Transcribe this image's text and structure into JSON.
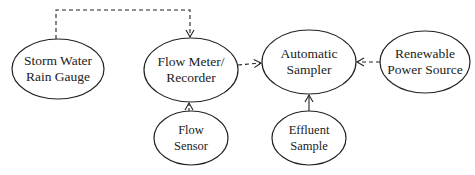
{
  "diagram": {
    "nodes": [
      {
        "id": "rain",
        "label_1": "Storm Water",
        "label_2": "Rain Gauge"
      },
      {
        "id": "meter",
        "label_1": "Flow Meter/",
        "label_2": "Recorder"
      },
      {
        "id": "sampler",
        "label_1": "Automatic",
        "label_2": "Sampler"
      },
      {
        "id": "power",
        "label_1": "Renewable",
        "label_2": "Power Source"
      },
      {
        "id": "sensor",
        "label_1": "Flow",
        "label_2": "Sensor"
      },
      {
        "id": "effluent",
        "label_1": "Effluent",
        "label_2": "Sample"
      }
    ],
    "edges": [
      {
        "from": "rain",
        "to": "meter",
        "style": "dashed"
      },
      {
        "from": "meter",
        "to": "sampler",
        "style": "dashed"
      },
      {
        "from": "power",
        "to": "sampler",
        "style": "dashed"
      },
      {
        "from": "sensor",
        "to": "meter",
        "style": "dashed"
      },
      {
        "from": "effluent",
        "to": "sampler",
        "style": "solid"
      }
    ],
    "colors": {
      "stroke": "#222222",
      "background": "#ffffff"
    }
  }
}
